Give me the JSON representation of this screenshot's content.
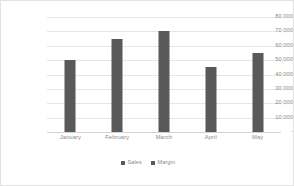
{
  "chart_data": {
    "type": "bar",
    "title": "",
    "subtitle": "",
    "xlabel": "",
    "ylabel": "",
    "categories": [
      "January",
      "February",
      "March",
      "April",
      "May"
    ],
    "series": [
      {
        "name": "Sales",
        "color": "#595959",
        "values": [
          50000,
          65000,
          70000,
          45000,
          55000
        ]
      },
      {
        "name": "Margin",
        "color": "#595959",
        "values": [
          0,
          0,
          0,
          0,
          0
        ]
      }
    ],
    "ylim": [
      0,
      80000
    ],
    "ytick_values": [
      0,
      10000,
      20000,
      30000,
      40000,
      50000,
      60000,
      70000,
      80000
    ],
    "ytick_labels": [
      "-",
      "10,000",
      "20,000",
      "30,000",
      "40,000",
      "50,000",
      "60,000",
      "70,000",
      "80,000"
    ],
    "grid": true,
    "grid_axis": "y",
    "grid_color": "#e6e6e6",
    "legend": true,
    "legend_position": "bottom",
    "legend_entries": [
      "Sales",
      "Margin"
    ],
    "plot_background": "#ffffff",
    "border_color": "#e2e2e2"
  }
}
